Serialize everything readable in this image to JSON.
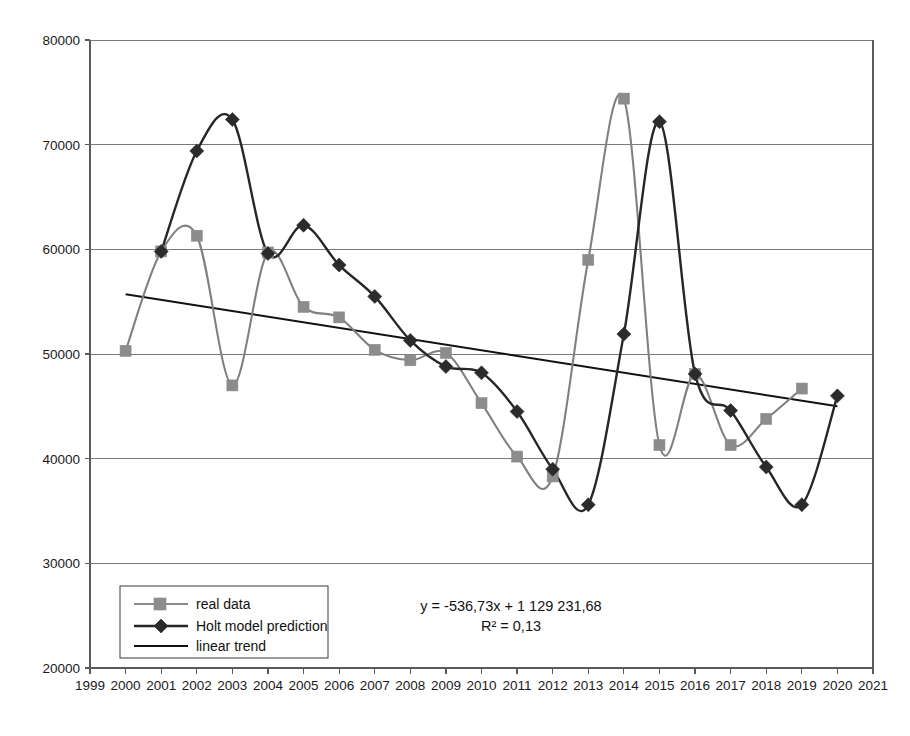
{
  "chart_data": {
    "type": "line",
    "title": "",
    "subtitle": "",
    "xlabel": "",
    "ylabel": "",
    "xlim": [
      1999,
      2021
    ],
    "ylim": [
      20000,
      80000
    ],
    "grid": true,
    "legend_position": "bottom-left",
    "x_ticks": [
      1999,
      2000,
      2001,
      2002,
      2003,
      2004,
      2005,
      2006,
      2007,
      2008,
      2009,
      2010,
      2011,
      2012,
      2013,
      2014,
      2015,
      2016,
      2017,
      2018,
      2019,
      2020,
      2021
    ],
    "y_ticks": [
      20000,
      30000,
      40000,
      50000,
      60000,
      70000,
      80000
    ],
    "series": [
      {
        "name": "real data",
        "color": "#8c8c8c",
        "marker": "square",
        "x": [
          2000,
          2001,
          2002,
          2003,
          2004,
          2005,
          2006,
          2007,
          2008,
          2009,
          2010,
          2011,
          2012,
          2013,
          2014,
          2015,
          2016,
          2017,
          2018,
          2019
        ],
        "values": [
          50300,
          59800,
          61300,
          47000,
          59700,
          54500,
          53500,
          50400,
          49400,
          50100,
          45300,
          40200,
          38300,
          59000,
          74400,
          41300,
          48100,
          41300,
          43800,
          46700
        ]
      },
      {
        "name": "Holt model prediction",
        "color": "#2b2b2b",
        "marker": "diamond",
        "x": [
          2001,
          2002,
          2003,
          2004,
          2005,
          2006,
          2007,
          2008,
          2009,
          2010,
          2011,
          2012,
          2013,
          2014,
          2015,
          2016,
          2017,
          2018,
          2019,
          2020
        ],
        "values": [
          59800,
          69400,
          72400,
          59600,
          62300,
          58500,
          55500,
          51300,
          48800,
          48200,
          44500,
          39000,
          35600,
          51900,
          72200,
          48100,
          44600,
          39200,
          35600,
          46000
        ]
      },
      {
        "name": "linear trend",
        "color": "#111111",
        "marker": "none",
        "x": [
          2000,
          2020
        ],
        "values": [
          55700,
          45000
        ]
      }
    ],
    "annotations": [
      {
        "name": "trend-equation",
        "text": "y = -536,73x + 1 129 231,68"
      },
      {
        "name": "r-squared",
        "text": "R² = 0,13"
      }
    ]
  },
  "legend": {
    "items": [
      {
        "label": "real data"
      },
      {
        "label": "Holt model prediction"
      },
      {
        "label": "linear trend"
      }
    ]
  },
  "axis_labels": {
    "y": [
      "80000",
      "70000",
      "60000",
      "50000",
      "40000",
      "30000",
      "20000"
    ],
    "x": [
      "1999",
      "2000",
      "2001",
      "2002",
      "2003",
      "2004",
      "2005",
      "2006",
      "2007",
      "2008",
      "2009",
      "2010",
      "2011",
      "2012",
      "2013",
      "2014",
      "2015",
      "2016",
      "2017",
      "2018",
      "2019",
      "2020",
      "2021"
    ]
  },
  "equation": {
    "line1": "y = -536,73x + 1 129 231,68",
    "line2": "R² = 0,13"
  }
}
